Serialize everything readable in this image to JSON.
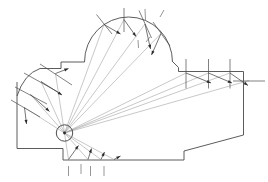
{
  "diagram": {
    "kind": "ray-trace-building-section",
    "canvas": {
      "width": 268,
      "height": 182,
      "background": "#ffffff"
    },
    "colors": {
      "outline": "#4a4a4a",
      "incident_ray": "#9a9a9a",
      "reflected_ray": "#3a3a3a",
      "normal": "#4a4a4a",
      "source": "#2a2a2a"
    },
    "source": {
      "label": "sound-source",
      "x": 64.5,
      "y": 133.0,
      "radius": 8.2,
      "dot_radius": 1.4
    },
    "building_outline": {
      "label": "building-section-outline",
      "points": [
        [
          17.0,
          82.0
        ],
        [
          17.0,
          148.5
        ],
        [
          63.0,
          148.5
        ],
        [
          63.0,
          160.0
        ],
        [
          184.0,
          160.0
        ],
        [
          184.0,
          151.0
        ],
        [
          243.5,
          135.0
        ],
        [
          243.5,
          71.5
        ],
        [
          178.5,
          71.5
        ],
        [
          178.5,
          67.5
        ],
        [
          172.5,
          61.5
        ]
      ],
      "dome": {
        "label": "dome-arc",
        "cx": 128.5,
        "cy": 62.0,
        "rx": 44.0,
        "ry": 45.0,
        "start": [
          84.5,
          62.0
        ],
        "end": [
          172.5,
          62.0
        ]
      },
      "left_step": [
        [
          84.5,
          62.0
        ],
        [
          84.5,
          62.0
        ],
        [
          61.0,
          62.0
        ],
        [
          61.0,
          68.5
        ],
        [
          40.0,
          68.5
        ]
      ],
      "left_curve": {
        "label": "left-curved-wall",
        "from": [
          40.0,
          68.5
        ],
        "control": [
          24.0,
          74.0
        ],
        "to": [
          17.0,
          96.0
        ]
      }
    },
    "surfaces": [
      {
        "id": "dome-left",
        "name": "dome-surface-left",
        "x": 104.0,
        "y": 24.0
      },
      {
        "id": "dome-top1",
        "name": "dome-surface-top-1",
        "x": 124.0,
        "y": 19.0
      },
      {
        "id": "dome-top2",
        "name": "dome-surface-top-2",
        "x": 145.0,
        "y": 23.5
      },
      {
        "id": "dome-right",
        "name": "dome-surface-right",
        "x": 161.0,
        "y": 33.0
      },
      {
        "id": "right-1",
        "name": "right-wall-panel-1",
        "x": 186.0,
        "y": 72.5
      },
      {
        "id": "right-2",
        "name": "right-wall-panel-2",
        "x": 208.5,
        "y": 72.5
      },
      {
        "id": "right-3",
        "name": "right-wall-panel-3",
        "x": 230.0,
        "y": 72.5
      },
      {
        "id": "right-4",
        "name": "right-wall-panel-4",
        "x": 249.0,
        "y": 80.0
      },
      {
        "id": "left-1",
        "name": "left-wall-panel-1",
        "x": 55.0,
        "y": 74.0
      },
      {
        "id": "left-2",
        "name": "left-wall-panel-2",
        "x": 40.5,
        "y": 82.0
      },
      {
        "id": "left-3",
        "name": "left-wall-panel-3",
        "x": 30.0,
        "y": 95.0
      },
      {
        "id": "left-4",
        "name": "left-wall-panel-4",
        "x": 24.0,
        "y": 108.0
      },
      {
        "id": "floor-1",
        "name": "floor-panel-1",
        "x": 68.5,
        "y": 160.0
      },
      {
        "id": "floor-2",
        "name": "floor-panel-2",
        "x": 88.0,
        "y": 160.0
      },
      {
        "id": "floor-3",
        "name": "floor-panel-3",
        "x": 101.0,
        "y": 160.0
      },
      {
        "id": "floor-4",
        "name": "floor-panel-4",
        "x": 114.0,
        "y": 160.0
      }
    ],
    "incident_rays": [
      {
        "name": "incident-ray-dome-left",
        "from": [
          64.5,
          133.0
        ],
        "to": [
          104.0,
          24.5
        ]
      },
      {
        "name": "incident-ray-dome-top1",
        "from": [
          64.5,
          133.0
        ],
        "to": [
          124.0,
          19.5
        ]
      },
      {
        "name": "incident-ray-dome-top2",
        "from": [
          64.5,
          133.0
        ],
        "to": [
          145.0,
          24.0
        ]
      },
      {
        "name": "incident-ray-dome-right",
        "from": [
          64.5,
          133.0
        ],
        "to": [
          161.0,
          33.5
        ]
      },
      {
        "name": "incident-ray-right-1",
        "from": [
          64.5,
          133.0
        ],
        "to": [
          186.0,
          73.0
        ]
      },
      {
        "name": "incident-ray-right-2",
        "from": [
          64.5,
          133.0
        ],
        "to": [
          208.5,
          73.0
        ]
      },
      {
        "name": "incident-ray-right-3",
        "from": [
          64.5,
          133.0
        ],
        "to": [
          230.0,
          73.0
        ]
      },
      {
        "name": "incident-ray-right-4",
        "from": [
          64.5,
          133.0
        ],
        "to": [
          249.0,
          80.5
        ]
      },
      {
        "name": "incident-ray-left-1",
        "from": [
          64.5,
          133.0
        ],
        "to": [
          55.5,
          73.5
        ]
      },
      {
        "name": "incident-ray-left-2",
        "from": [
          64.5,
          133.0
        ],
        "to": [
          41.0,
          81.5
        ]
      },
      {
        "name": "incident-ray-left-3",
        "from": [
          64.5,
          133.0
        ],
        "to": [
          30.5,
          94.5
        ]
      },
      {
        "name": "incident-ray-left-4",
        "from": [
          64.5,
          133.0
        ],
        "to": [
          24.5,
          107.5
        ]
      },
      {
        "name": "incident-ray-floor-1",
        "from": [
          64.5,
          133.0
        ],
        "to": [
          68.5,
          159.5
        ]
      },
      {
        "name": "incident-ray-floor-2",
        "from": [
          64.5,
          133.0
        ],
        "to": [
          88.0,
          159.5
        ]
      },
      {
        "name": "incident-ray-floor-3",
        "from": [
          64.5,
          133.0
        ],
        "to": [
          101.0,
          159.5
        ]
      },
      {
        "name": "incident-ray-floor-4",
        "from": [
          64.5,
          133.0
        ],
        "to": [
          114.0,
          159.5
        ]
      }
    ],
    "reflected_rays": [
      {
        "name": "reflected-ray-dome-left",
        "from": [
          104.0,
          24.5
        ],
        "to": [
          120.5,
          34.0
        ],
        "head": "end"
      },
      {
        "name": "reflected-ray-dome-top1",
        "from": [
          124.0,
          19.5
        ],
        "to": [
          136.0,
          36.5
        ],
        "head": "end"
      },
      {
        "name": "reflected-ray-dome-top2",
        "from": [
          145.0,
          24.0
        ],
        "to": [
          150.5,
          49.0
        ],
        "head": "end"
      },
      {
        "name": "reflected-ray-dome-right",
        "from": [
          161.0,
          33.5
        ],
        "to": [
          151.5,
          55.0
        ],
        "head": "end"
      },
      {
        "name": "reflected-ray-right-1",
        "from": [
          186.0,
          73.0
        ],
        "to": [
          211.0,
          83.0
        ],
        "head": "end"
      },
      {
        "name": "reflected-ray-right-2",
        "from": [
          208.5,
          73.0
        ],
        "to": [
          232.0,
          83.0
        ],
        "head": "end"
      },
      {
        "name": "reflected-ray-right-3",
        "from": [
          230.0,
          73.0
        ],
        "to": [
          248.0,
          85.5
        ],
        "head": "end"
      },
      {
        "name": "reflected-ray-left-1",
        "from": [
          55.5,
          73.5
        ],
        "to": [
          68.5,
          68.5
        ],
        "head": "end"
      },
      {
        "name": "reflected-ray-left-2",
        "from": [
          41.0,
          81.5
        ],
        "to": [
          62.0,
          95.0
        ],
        "head": "end"
      },
      {
        "name": "reflected-ray-left-3",
        "from": [
          30.5,
          94.5
        ],
        "to": [
          49.5,
          111.5
        ],
        "head": "end"
      },
      {
        "name": "reflected-ray-left-4",
        "from": [
          24.5,
          107.5
        ],
        "to": [
          26.5,
          124.0
        ],
        "head": "end"
      },
      {
        "name": "reflected-ray-floor-1",
        "from": [
          68.5,
          159.5
        ],
        "to": [
          78.5,
          145.5
        ],
        "head": "end"
      },
      {
        "name": "reflected-ray-floor-2",
        "from": [
          88.0,
          159.5
        ],
        "to": [
          91.5,
          148.5
        ],
        "head": "end"
      },
      {
        "name": "reflected-ray-floor-3",
        "from": [
          101.0,
          159.5
        ],
        "to": [
          104.5,
          152.0
        ],
        "head": "end"
      },
      {
        "name": "reflected-ray-floor-4",
        "from": [
          114.0,
          159.5
        ],
        "to": [
          120.5,
          156.0
        ],
        "head": "end"
      }
    ],
    "normals": [
      {
        "name": "normal-dome-left",
        "from": [
          96.5,
          14.5
        ],
        "to": [
          112.0,
          34.0
        ]
      },
      {
        "name": "normal-dome-top1",
        "from": [
          124.0,
          8.0
        ],
        "to": [
          124.0,
          32.0
        ]
      },
      {
        "name": "normal-dome-top2",
        "from": [
          139.0,
          10.5
        ],
        "to": [
          151.5,
          38.0
        ]
      },
      {
        "name": "normal-dome-right",
        "from": [
          153.0,
          22.0
        ],
        "to": [
          170.0,
          46.0
        ]
      },
      {
        "name": "normal-right-1",
        "from": [
          186.0,
          59.0
        ],
        "to": [
          186.0,
          88.5
        ]
      },
      {
        "name": "normal-right-2",
        "from": [
          208.5,
          59.0
        ],
        "to": [
          208.5,
          88.5
        ]
      },
      {
        "name": "normal-right-3",
        "from": [
          230.0,
          59.0
        ],
        "to": [
          230.0,
          88.5
        ]
      },
      {
        "name": "normal-right-4",
        "from": [
          233.0,
          81.0
        ],
        "to": [
          265.0,
          81.0
        ]
      },
      {
        "name": "normal-left-1",
        "from": [
          40.0,
          64.0
        ],
        "to": [
          72.0,
          85.0
        ]
      },
      {
        "name": "normal-left-2",
        "from": [
          24.0,
          73.0
        ],
        "to": [
          58.0,
          92.0
        ]
      },
      {
        "name": "normal-left-3",
        "from": [
          15.0,
          87.0
        ],
        "to": [
          47.0,
          104.0
        ]
      },
      {
        "name": "normal-left-4",
        "from": [
          11.0,
          100.0
        ],
        "to": [
          40.0,
          117.0
        ]
      }
    ],
    "floor_ticks": [
      {
        "name": "floor-tick-1",
        "x": 68.5,
        "y1": 166.0,
        "y2": 176.0
      },
      {
        "name": "floor-tick-2",
        "x": 81.0,
        "y1": 164.0,
        "y2": 174.0
      },
      {
        "name": "floor-tick-3",
        "x": 90.5,
        "y1": 166.0,
        "y2": 176.0
      },
      {
        "name": "floor-tick-4",
        "x": 104.0,
        "y1": 166.0,
        "y2": 176.0
      }
    ],
    "dome_ticks": [
      {
        "name": "dome-tick-1",
        "x1": 145.0,
        "y1": 9.0,
        "x2": 145.5,
        "y2": 20.0
      },
      {
        "name": "dome-tick-2",
        "x1": 160.0,
        "y1": 17.0,
        "x2": 164.0,
        "y2": 10.0
      },
      {
        "name": "dome-tick-3",
        "x1": 138.0,
        "y1": 40.0,
        "x2": 138.5,
        "y2": 48.0
      },
      {
        "name": "dome-tick-4",
        "x1": 146.0,
        "y1": 42.0,
        "x2": 150.0,
        "y2": 37.0
      }
    ]
  }
}
